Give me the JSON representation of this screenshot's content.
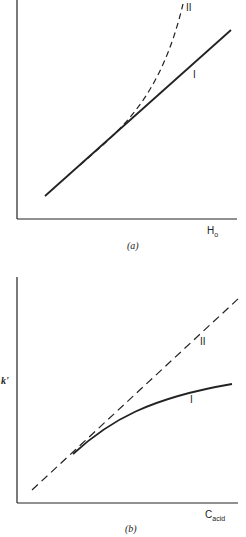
{
  "panels": [
    {
      "id": "a",
      "caption": "(a)",
      "xlabel": "H",
      "xlabel_sub": "o",
      "ylabel": "",
      "curves": [
        {
          "label": "I",
          "style": "solid",
          "shape": "linear"
        },
        {
          "label": "II",
          "style": "dashed",
          "shape": "convex-upward"
        }
      ]
    },
    {
      "id": "b",
      "caption": "(b)",
      "xlabel": "C",
      "xlabel_sub": "acid",
      "ylabel": "k'",
      "curves": [
        {
          "label": "I",
          "style": "solid",
          "shape": "concave-saturating"
        },
        {
          "label": "II",
          "style": "dashed",
          "shape": "linear"
        }
      ]
    }
  ],
  "colors": {
    "ink": "#222222",
    "background": "#ffffff"
  }
}
